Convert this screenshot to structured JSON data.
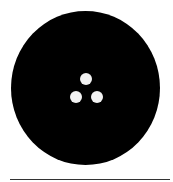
{
  "figure": {
    "shape": "sewing-button",
    "disc_color": "#000000",
    "hole_color": "#f2f2f2",
    "line_color": "#333333",
    "hole_count": 3,
    "holes": [
      {
        "name": "top",
        "cx": 86,
        "cy": 79
      },
      {
        "name": "bottom-left",
        "cx": 76,
        "cy": 97
      },
      {
        "name": "bottom-right",
        "cx": 97,
        "cy": 97
      }
    ]
  }
}
